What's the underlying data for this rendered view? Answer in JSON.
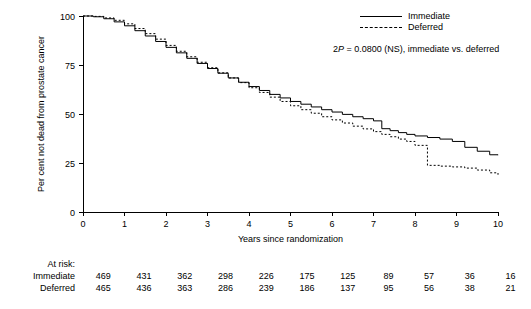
{
  "chart_data": {
    "type": "line",
    "title": "",
    "xlabel": "Years since randomization",
    "ylabel": "Per cent not dead from prostate cancer",
    "xlim": [
      0,
      10
    ],
    "ylim": [
      0,
      100
    ],
    "xticks": [
      "0",
      "1",
      "2",
      "3",
      "4",
      "5",
      "6",
      "7",
      "8",
      "9",
      "10"
    ],
    "yticks": [
      "0",
      "25",
      "50",
      "75",
      "100"
    ],
    "grid": false,
    "legend_position": "top-right",
    "annotation": "2P = 0.0800 (NS), immediate vs. deferred",
    "series": [
      {
        "name": "Immediate",
        "style": "solid",
        "x": [
          0,
          0.25,
          0.5,
          0.75,
          1.0,
          1.25,
          1.5,
          1.75,
          2.0,
          2.25,
          2.5,
          2.75,
          3.0,
          3.25,
          3.5,
          3.75,
          4.0,
          4.25,
          4.5,
          4.75,
          5.0,
          5.25,
          5.5,
          5.75,
          6.0,
          6.25,
          6.5,
          6.75,
          7.0,
          7.2,
          7.4,
          7.6,
          7.8,
          8.0,
          8.3,
          8.6,
          8.9,
          9.2,
          9.5,
          9.8,
          10.0
        ],
        "values": [
          100,
          99.6,
          98.6,
          97.0,
          95.0,
          92.5,
          89.8,
          87.0,
          84.0,
          81.2,
          78.4,
          75.8,
          73.2,
          70.8,
          68.4,
          66.2,
          64.0,
          62.0,
          60.0,
          58.2,
          56.4,
          55.0,
          53.6,
          52.2,
          51.0,
          49.8,
          48.6,
          47.6,
          46.5,
          42.5,
          41.5,
          40.5,
          39.6,
          38.8,
          38.0,
          37.2,
          36.0,
          33.0,
          31.0,
          29.2,
          29.0
        ]
      },
      {
        "name": "Deferred",
        "style": "dotted",
        "x": [
          0,
          0.25,
          0.5,
          0.75,
          1.0,
          1.25,
          1.5,
          1.75,
          2.0,
          2.25,
          2.5,
          2.75,
          3.0,
          3.25,
          3.5,
          3.75,
          4.0,
          4.25,
          4.5,
          4.75,
          5.0,
          5.25,
          5.5,
          5.75,
          6.0,
          6.25,
          6.5,
          6.75,
          7.0,
          7.2,
          7.4,
          7.6,
          7.8,
          8.0,
          8.3,
          8.6,
          8.9,
          9.2,
          9.5,
          9.8,
          10.0
        ],
        "values": [
          100,
          99.8,
          99.0,
          97.8,
          96.0,
          93.6,
          91.0,
          88.2,
          85.0,
          82.0,
          79.2,
          76.4,
          73.6,
          71.0,
          68.4,
          66.0,
          63.4,
          61.0,
          58.6,
          56.4,
          54.2,
          52.2,
          50.4,
          48.6,
          47.0,
          45.4,
          43.8,
          42.4,
          41.0,
          39.6,
          38.4,
          37.2,
          36.0,
          34.0,
          23.8,
          23.4,
          23.0,
          22.4,
          21.4,
          20.0,
          19.0
        ]
      }
    ]
  },
  "legend": {
    "items": [
      {
        "label": "Immediate",
        "style": "solid"
      },
      {
        "label": "Deferred",
        "style": "dashed"
      }
    ]
  },
  "pvalue": {
    "prefix": "2",
    "italic_p": "P",
    "suffix": " = 0.0800 (NS), immediate vs. deferred"
  },
  "atrisk": {
    "title": "At risk:",
    "rows": [
      {
        "label": "Immediate",
        "values": [
          "469",
          "431",
          "362",
          "298",
          "226",
          "175",
          "125",
          "89",
          "57",
          "36",
          "16"
        ]
      },
      {
        "label": "Deferred",
        "values": [
          "465",
          "436",
          "363",
          "286",
          "239",
          "186",
          "137",
          "95",
          "56",
          "38",
          "21"
        ]
      }
    ]
  }
}
